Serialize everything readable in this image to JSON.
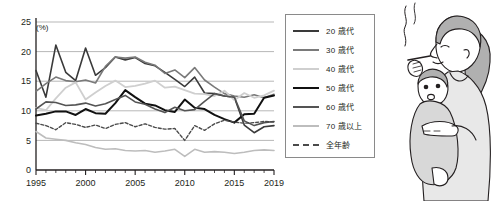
{
  "chart_data": {
    "type": "line",
    "title": "",
    "xlabel": "",
    "ylabel": "",
    "unit_label": "(%)",
    "ylim": [
      0,
      25
    ],
    "yticks": [
      0,
      5,
      10,
      15,
      20,
      25
    ],
    "xlim": [
      1995,
      2019
    ],
    "xticks_major": [
      1995,
      2000,
      2005,
      2010,
      2015,
      2019
    ],
    "xticks_minor_step": 1,
    "grid": "horizontal",
    "legend_position": "right",
    "x": [
      1995,
      1996,
      1997,
      1998,
      1999,
      2000,
      2001,
      2002,
      2003,
      2004,
      2005,
      2006,
      2007,
      2008,
      2009,
      2010,
      2011,
      2012,
      2013,
      2014,
      2015,
      2016,
      2017,
      2018,
      2019
    ],
    "series": [
      {
        "name": "20 歳代",
        "color": "#3a3a3a",
        "width": 1.6,
        "dash": "none",
        "values": [
          16.8,
          12.3,
          21.1,
          16.5,
          15.1,
          20.6,
          16.0,
          17.3,
          19.1,
          18.6,
          19.0,
          18.0,
          17.6,
          16.5,
          15.3,
          14.1,
          15.7,
          13.0,
          12.9,
          12.5,
          12.3,
          7.6,
          6.3,
          7.3,
          7.5
        ]
      },
      {
        "name": "30 歳代",
        "color": "#7a7a7a",
        "width": 1.6,
        "dash": "none",
        "values": [
          13.3,
          14.6,
          15.7,
          15.1,
          14.9,
          15.2,
          14.7,
          17.5,
          19.1,
          18.9,
          19.1,
          18.2,
          17.7,
          16.3,
          16.9,
          15.6,
          17.3,
          15.2,
          14.0,
          12.9,
          12.5,
          12.3,
          12.7,
          12.2,
          12.8
        ]
      },
      {
        "name": "40 歳代",
        "color": "#cfcfcf",
        "width": 1.8,
        "dash": "none",
        "values": [
          10.5,
          10.1,
          12.1,
          13.9,
          14.8,
          11.9,
          13.1,
          14.2,
          15.1,
          14.0,
          14.2,
          14.6,
          15.1,
          13.9,
          14.1,
          13.5,
          12.9,
          12.8,
          12.5,
          13.4,
          11.8,
          13.0,
          12.2,
          12.6,
          13.4
        ]
      },
      {
        "name": "50 歳代",
        "color": "#111111",
        "width": 2.0,
        "dash": "none",
        "values": [
          9.2,
          9.5,
          9.9,
          9.9,
          9.3,
          10.3,
          9.6,
          9.5,
          11.3,
          13.5,
          12.3,
          11.2,
          10.9,
          10.1,
          9.8,
          11.9,
          10.5,
          10.3,
          9.3,
          8.6,
          8.0,
          9.4,
          9.5,
          12.2,
          12.6
        ]
      },
      {
        "name": "60 歳代",
        "color": "#545454",
        "width": 1.6,
        "dash": "none",
        "values": [
          10.3,
          11.5,
          11.4,
          10.9,
          11.0,
          11.3,
          10.8,
          11.2,
          11.9,
          12.6,
          11.5,
          11.1,
          10.3,
          9.7,
          10.6,
          10.0,
          10.2,
          11.6,
          12.9,
          12.5,
          12.3,
          8.3,
          7.5,
          8.0,
          8.2
        ]
      },
      {
        "name": "70 歳以上",
        "color": "#bdbdbd",
        "width": 1.6,
        "dash": "none",
        "values": [
          6.5,
          5.4,
          5.2,
          5.0,
          4.6,
          4.3,
          3.8,
          3.5,
          3.6,
          3.3,
          3.2,
          3.3,
          3.0,
          3.2,
          3.5,
          2.3,
          3.5,
          3.0,
          3.1,
          3.0,
          2.8,
          3.0,
          3.3,
          3.4,
          3.3
        ]
      },
      {
        "name": "全年齢",
        "color": "#4a4a4a",
        "width": 1.4,
        "dash": "3,2",
        "values": [
          7.9,
          7.5,
          6.8,
          8.0,
          7.7,
          7.2,
          7.6,
          7.0,
          7.7,
          8.0,
          7.3,
          7.8,
          7.2,
          6.9,
          7.0,
          5.0,
          7.5,
          6.7,
          7.8,
          8.4,
          8.1,
          7.9,
          8.0,
          8.2,
          8.1
        ]
      }
    ]
  },
  "legend": {
    "items": [
      {
        "label": "20 歳代"
      },
      {
        "label": "30 歳代"
      },
      {
        "label": "40 歳代"
      },
      {
        "label": "50 歳代"
      },
      {
        "label": "60 歳代"
      },
      {
        "label": "70 歳以上"
      },
      {
        "label": "全年齢"
      }
    ]
  },
  "illustration": {
    "name": "woman-smoking-holding-child",
    "description": "イラスト：子どもを抱きながらタバコを吸う女性"
  }
}
